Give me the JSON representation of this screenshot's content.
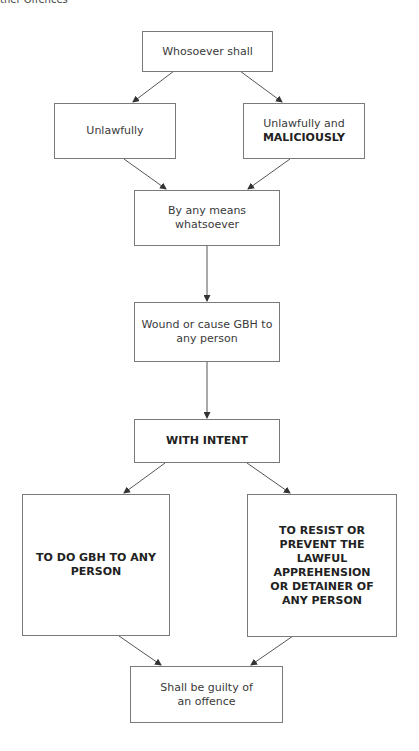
{
  "header": {
    "text": "ther Offences"
  },
  "nodes": {
    "whosoever": {
      "text": "Whosoever shall"
    },
    "unlawfully": {
      "text": "Unlawfully"
    },
    "unlawfully_malicious": {
      "line1": "Unlawfully and",
      "line2": "MALICIOUSLY"
    },
    "means": {
      "text": "By any means whatsoever"
    },
    "wound": {
      "text": "Wound or cause GBH to any person"
    },
    "intent": {
      "text": "WITH INTENT"
    },
    "gbh": {
      "text": "TO DO GBH TO ANY PERSON"
    },
    "resist": {
      "text": "TO RESIST OR PREVENT THE LAWFUL APPREHENSION OR DETAINER OF ANY PERSON"
    },
    "guilty": {
      "text": "Shall be guilty of an offence"
    }
  },
  "colors": {
    "border": "#7a7a7a",
    "arrow": "#555555",
    "text": "#3a3a3a"
  }
}
